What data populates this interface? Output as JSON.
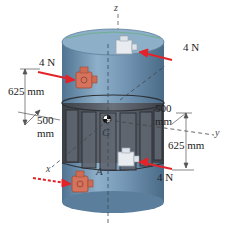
{
  "figure": {
    "colors": {
      "body": "#6f94b3",
      "body_dark": "#4f7391",
      "body_light": "#9dbbd3",
      "band": "#4a4f57",
      "thruster_front": "#d6735d",
      "thruster_back": "#e4e8ec",
      "force_arrow": "#e2232a"
    },
    "axes": {
      "x": "x",
      "y": "y",
      "z": "z"
    },
    "points": {
      "center_of_mass": "G",
      "thruster_point": "A"
    },
    "forces": {
      "top_left": "4 N",
      "top_right": "4 N",
      "bottom_right": "4 N"
    },
    "dimensions": {
      "left_vertical": "625 mm",
      "left_radius_value": "500",
      "left_radius_unit": "mm",
      "right_radius_value": "500",
      "right_radius_unit": "mm",
      "right_vertical": "625 mm"
    }
  }
}
